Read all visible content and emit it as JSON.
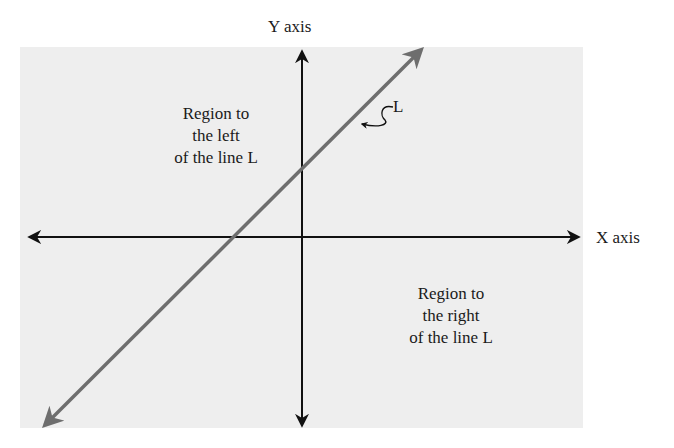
{
  "diagram": {
    "axes": {
      "x_label": "X axis",
      "y_label": "Y axis"
    },
    "line": {
      "label": "L",
      "color": "#6e6e6e"
    },
    "regions": {
      "left": {
        "lines": [
          "Region to",
          "the left",
          "of the line L"
        ]
      },
      "right": {
        "lines": [
          "Region to",
          "the right",
          "of the line L"
        ]
      }
    },
    "colors": {
      "panel": "#eeeeee",
      "axes": "#111111",
      "line_L": "#6e6e6e",
      "text": "#1a1a1a"
    }
  }
}
